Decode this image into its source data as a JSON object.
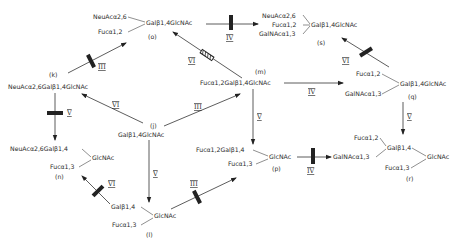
{
  "diagram": {
    "nodes": {
      "o": {
        "label": "(o)",
        "line1": "NeuAcα2,6",
        "line2": "Fucα1,2",
        "core": "Galβ1,4GlcNAc"
      },
      "s": {
        "label": "(s)",
        "line1": "NeuAcα2,6",
        "line2": "Fucα1,2",
        "line3": "GalNAcα1,3",
        "core": "Galβ1,4GlcNAc"
      },
      "k": {
        "label": "(k)",
        "text": "NeuAcα2,6Galβ1,4GlcNAc"
      },
      "m": {
        "label": "(m)",
        "text": "Fucα1,2Galβ1,4GlcNAc"
      },
      "q": {
        "label": "(q)",
        "line1": "Fucα1,2",
        "line2": "GalNAcα1,3",
        "core": "Galβ1,4GlcNAc"
      },
      "j": {
        "label": "(j)",
        "text": "Galβ1,4GlcNAc"
      },
      "n": {
        "label": "(n)",
        "line1": "NeuAcα2,6Galβ1,4",
        "line2": "Fucα1,3",
        "core": "GlcNAc"
      },
      "p": {
        "label": "(p)",
        "line1": "Fucα1,2Galβ1,4",
        "line2": "Fucα1,3",
        "core": "GlcNAc"
      },
      "r": {
        "label": "(r)",
        "line1": "Fucα1,2",
        "line2": "GalNAcα1,3",
        "mid": "Galβ1,4",
        "line3": "Fucα1,3",
        "core": "GlcNAc"
      },
      "l": {
        "label": "(l)",
        "line1": "Galβ1,4",
        "line2": "Fucα1,3",
        "core": "GlcNAc"
      }
    },
    "enzymes": {
      "k_to_o": "III",
      "o_to_s": "IV",
      "m_to_o": "VI",
      "q_to_s": "VI",
      "j_to_k": "VI",
      "j_to_m": "III",
      "m_to_q": "IV",
      "k_to_n": "V",
      "j_to_l": "V",
      "m_to_p": "V",
      "q_to_r": "V",
      "l_to_n": "VI",
      "l_to_p": "III",
      "p_to_r": "IV"
    }
  }
}
